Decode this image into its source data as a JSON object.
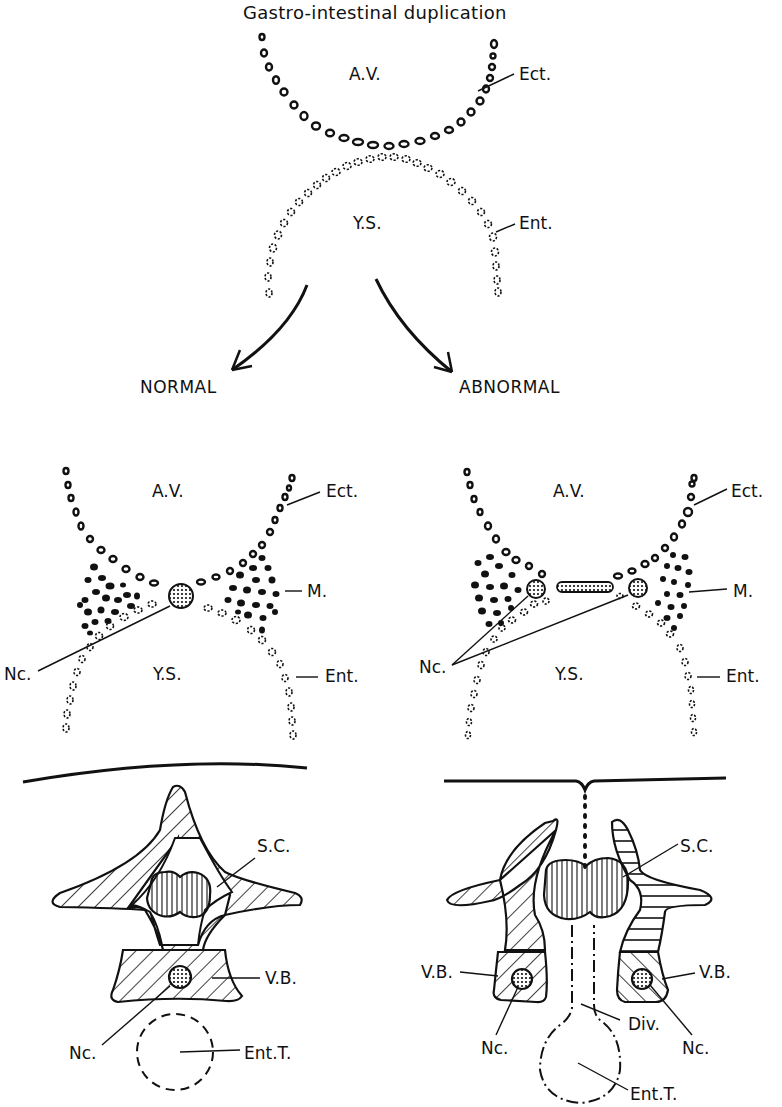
{
  "figure": {
    "title": "Gastro-intestinal duplication",
    "top_panel": {
      "labels": {
        "amniotic_cavity": "A.V.",
        "yolk_sac": "Y.S.",
        "ectoderm": "Ect.",
        "entoderm": "Ent."
      }
    },
    "branches": {
      "left": "NORMAL",
      "right": "ABNORMAL"
    },
    "normal_embryo": {
      "labels": {
        "amniotic_cavity": "A.V.",
        "ectoderm": "Ect.",
        "mesoderm": "M.",
        "notochord": "Nc.",
        "yolk_sac": "Y.S.",
        "entoderm": "Ent."
      }
    },
    "abnormal_embryo": {
      "labels": {
        "amniotic_cavity": "A.V.",
        "ectoderm": "Ect.",
        "mesoderm": "M.",
        "notochord": "Nc.",
        "yolk_sac": "Y.S.",
        "entoderm": "Ent."
      }
    },
    "normal_vertebra": {
      "labels": {
        "spinal_cord": "S.C.",
        "vertebral_body": "V.B.",
        "notochord": "Nc.",
        "enteric_tube": "Ent.T."
      }
    },
    "abnormal_vertebra": {
      "labels": {
        "spinal_cord": "S.C.",
        "vertebral_body_left": "V.B.",
        "vertebral_body_right": "V.B.",
        "diverticulum": "Div.",
        "notochord_left": "Nc.",
        "notochord_right": "Nc.",
        "enteric_tube": "Ent.T."
      }
    }
  }
}
